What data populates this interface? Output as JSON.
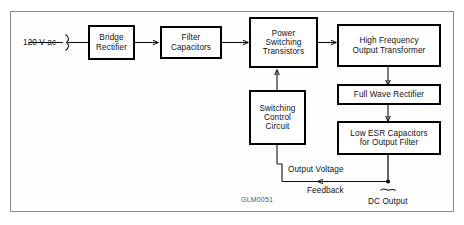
{
  "diagram": {
    "reference_code": "GLM0051",
    "input_label": "120 V ac",
    "blocks": [
      {
        "id": "bridge-rectifier",
        "label": "Bridge\nRectifier"
      },
      {
        "id": "filter-capacitors",
        "label": "Filter\nCapacitors"
      },
      {
        "id": "power-switching",
        "label": "Power\nSwitching\nTransistors"
      },
      {
        "id": "hf-transformer",
        "label": "High Frequency\nOutput Transformer"
      },
      {
        "id": "full-wave-rectifier",
        "label": "Full Wave Rectifier"
      },
      {
        "id": "low-esr-capacitors",
        "label": "Low ESR Capacitors\nfor Output Filter"
      },
      {
        "id": "switching-control",
        "label": "Switching\nControl\nCircuit"
      }
    ],
    "annotations": {
      "output_voltage": "Output Voltage",
      "feedback": "Feedback",
      "dc_output": "DC Output"
    },
    "colors": {
      "line": "#111111",
      "block_border": "#000000",
      "frame_border": "#8d8d8d",
      "background": "#ffffff"
    }
  }
}
